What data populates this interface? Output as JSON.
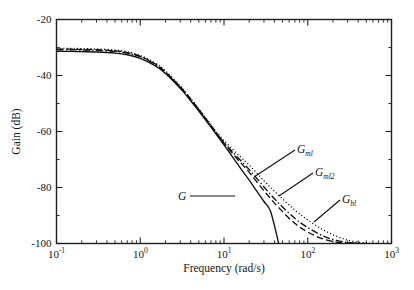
{
  "chart_data": {
    "type": "line",
    "title": "",
    "xlabel": "Frequency (rad/s)",
    "ylabel": "Gain (dB)",
    "xscale": "log",
    "xlim": [
      0.1,
      1000
    ],
    "ylim": [
      -100,
      -20
    ],
    "grid": false,
    "legend_position": "inline-annotations",
    "xticks": [
      {
        "value": 0.1,
        "mantissa": "10",
        "exponent": "-1"
      },
      {
        "value": 1,
        "mantissa": "10",
        "exponent": "0"
      },
      {
        "value": 10,
        "mantissa": "10",
        "exponent": "1"
      },
      {
        "value": 100,
        "mantissa": "10",
        "exponent": "2"
      },
      {
        "value": 1000,
        "mantissa": "10",
        "exponent": "3"
      }
    ],
    "yticks_major": [
      "-20",
      "-40",
      "-60",
      "-80",
      "-100"
    ],
    "yticks_major_values": [
      -20,
      -40,
      -60,
      -80,
      -100
    ],
    "yticks_minor_values": [
      -30,
      -50,
      -70,
      -90
    ],
    "series": [
      {
        "name": "G",
        "label_base": "G",
        "label_sub": "",
        "style": "solid",
        "x": [
          0.1,
          0.15,
          0.2,
          0.3,
          0.5,
          0.7,
          1.0,
          1.5,
          2.0,
          3.0,
          4.0,
          5.0,
          6.0,
          7.0,
          8.0,
          10.0,
          13.0,
          16.0,
          20.0,
          25.0,
          30.0,
          36.0,
          45.0
        ],
        "y": [
          -31.4,
          -31.4,
          -31.5,
          -31.6,
          -32.0,
          -32.6,
          -33.9,
          -36.5,
          -39.3,
          -44.6,
          -49.0,
          -52.7,
          -55.8,
          -58.5,
          -60.8,
          -64.8,
          -69.6,
          -73.4,
          -77.4,
          -81.6,
          -85.0,
          -88.6,
          -100.0
        ]
      },
      {
        "name": "Gml",
        "label_base": "G",
        "label_sub": "ml",
        "style": "dotted",
        "x": [
          0.1,
          0.15,
          0.2,
          0.3,
          0.5,
          0.7,
          1.0,
          1.5,
          2.0,
          3.0,
          4.0,
          5.0,
          6.0,
          7.0,
          8.0,
          10.0,
          14.0,
          20.0,
          30.0,
          45.0,
          70.0,
          100.0,
          150.0,
          220.0,
          320.0,
          470.0,
          700.0
        ],
        "y": [
          -30.3,
          -30.3,
          -30.4,
          -30.5,
          -30.9,
          -31.5,
          -32.8,
          -35.5,
          -38.4,
          -43.7,
          -48.2,
          -51.9,
          -55.0,
          -57.6,
          -59.9,
          -63.2,
          -67.6,
          -72.0,
          -77.6,
          -82.8,
          -88.0,
          -91.6,
          -95.0,
          -97.4,
          -99.0,
          -99.8,
          -100.0
        ]
      },
      {
        "name": "Gml2",
        "label_base": "G",
        "label_sub": "ml2",
        "style": "dashdot",
        "x": [
          0.1,
          0.15,
          0.2,
          0.3,
          0.5,
          0.7,
          1.0,
          1.5,
          2.0,
          3.0,
          4.0,
          5.0,
          6.0,
          7.0,
          8.0,
          10.0,
          14.0,
          20.0,
          30.0,
          45.0,
          70.0,
          100.0,
          150.0,
          220.0,
          320.0,
          490.0
        ],
        "y": [
          -30.8,
          -30.8,
          -30.9,
          -31.0,
          -31.4,
          -32.0,
          -33.3,
          -36.0,
          -38.9,
          -44.2,
          -48.6,
          -52.3,
          -55.4,
          -58.0,
          -60.3,
          -63.9,
          -68.7,
          -73.6,
          -79.8,
          -85.6,
          -91.0,
          -94.3,
          -97.2,
          -98.9,
          -99.7,
          -100.0
        ]
      },
      {
        "name": "Gbl",
        "label_base": "G",
        "label_sub": "bl",
        "style": "dashed",
        "x": [
          0.1,
          0.15,
          0.2,
          0.3,
          0.5,
          0.7,
          1.0,
          1.5,
          2.0,
          3.0,
          4.0,
          5.0,
          6.0,
          7.0,
          8.0,
          10.0,
          14.0,
          20.0,
          30.0,
          45.0,
          70.0,
          100.0,
          150.0,
          220.0,
          310.0,
          400.0
        ],
        "y": [
          -30.6,
          -30.6,
          -30.7,
          -30.8,
          -31.2,
          -31.8,
          -33.1,
          -35.8,
          -38.7,
          -44.0,
          -48.4,
          -52.1,
          -55.2,
          -57.9,
          -60.3,
          -64.2,
          -69.4,
          -74.6,
          -81.2,
          -87.2,
          -92.8,
          -95.9,
          -98.3,
          -99.5,
          -99.9,
          -100.0
        ]
      }
    ],
    "annotations": [
      {
        "name": "G",
        "label_base": "G",
        "label_sub": "",
        "text_x": 178,
        "text_y": 200,
        "leader": [
          [
            190,
            196
          ],
          [
            235,
            196
          ]
        ]
      },
      {
        "name": "Gml",
        "label_base": "G",
        "label_sub": "ml",
        "text_x": 297,
        "text_y": 153,
        "leader": [
          [
            295,
            150
          ],
          [
            254,
            177
          ]
        ]
      },
      {
        "name": "Gml2",
        "label_base": "G",
        "label_sub": "ml2",
        "text_x": 315,
        "text_y": 176,
        "leader": [
          [
            313,
            173
          ],
          [
            279,
            196
          ]
        ]
      },
      {
        "name": "Gbl",
        "label_base": "G",
        "label_sub": "bl",
        "text_x": 342,
        "text_y": 203,
        "leader": [
          [
            340,
            200
          ],
          [
            314,
            222
          ]
        ]
      }
    ]
  }
}
